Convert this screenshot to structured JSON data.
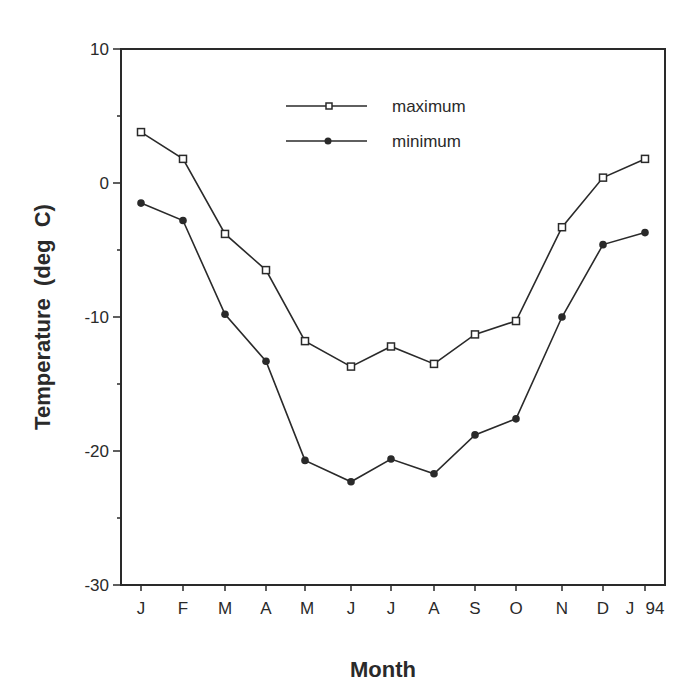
{
  "chart_data": {
    "type": "line",
    "title": "",
    "xlabel": "Month",
    "ylabel": "Temperature  (deg  C)",
    "categories": [
      "J",
      "F",
      "M",
      "A",
      "M",
      "J",
      "J",
      "A",
      "S",
      "O",
      "N",
      "D",
      "J 94"
    ],
    "x_tick_labels": [
      "J",
      "F",
      "M",
      "A",
      "M",
      "J",
      "J",
      "A",
      "S",
      "O",
      "N",
      "D",
      "J",
      "94"
    ],
    "y_ticks": [
      10,
      0,
      -10,
      -20,
      -30
    ],
    "ylim": [
      -30,
      10
    ],
    "grid": false,
    "legend_position": "upper center (inside plot)",
    "series": [
      {
        "name": "maximum",
        "marker": "open-square",
        "values": [
          3.8,
          1.8,
          -3.8,
          -6.5,
          -11.8,
          -13.7,
          -12.2,
          -13.5,
          -11.3,
          -10.3,
          -3.3,
          0.4,
          1.8
        ]
      },
      {
        "name": "minimum",
        "marker": "filled-circle",
        "values": [
          -1.5,
          -2.8,
          -9.8,
          -13.3,
          -20.7,
          -22.3,
          -20.6,
          -21.7,
          -18.8,
          -17.6,
          -10.0,
          -4.6,
          -3.7
        ]
      }
    ]
  },
  "colors": {
    "line": "#2a2a2a",
    "background": "#ffffff"
  }
}
